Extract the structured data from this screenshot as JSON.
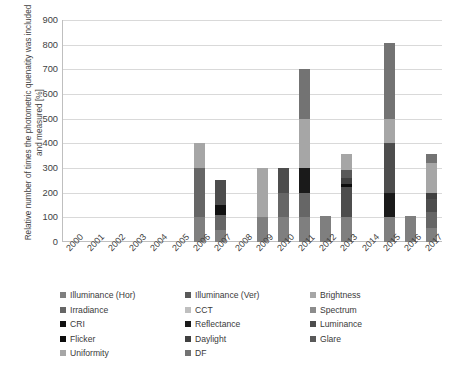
{
  "chart_data": {
    "type": "bar",
    "stacked": true,
    "title": "",
    "xlabel": "",
    "ylabel": "Relative number of times the photometric quenatity was included and measured [%]",
    "ylim": [
      0,
      900
    ],
    "ytick_step": 100,
    "yticks": [
      "0",
      "100",
      "200",
      "300",
      "400",
      "500",
      "600",
      "700",
      "800",
      "900"
    ],
    "grid": true,
    "legend_position": "bottom",
    "categories": [
      "2000",
      "2001",
      "2002",
      "2003",
      "2004",
      "2005",
      "2006",
      "2007",
      "2008",
      "2009",
      "2010",
      "2011",
      "2012",
      "2013",
      "2014",
      "2015",
      "2016",
      "2017"
    ],
    "series": [
      {
        "name": "Illuminance (Hor)",
        "color": "#7f7f7f",
        "values": [
          0,
          0,
          0,
          0,
          0,
          0,
          100,
          50,
          0,
          100,
          100,
          100,
          105,
          100,
          0,
          100,
          105,
          55
        ]
      },
      {
        "name": "Illuminance (Ver)",
        "color": "#595959",
        "values": [
          0,
          0,
          0,
          0,
          0,
          0,
          0,
          0,
          0,
          0,
          0,
          0,
          0,
          0,
          0,
          0,
          0,
          0
        ]
      },
      {
        "name": "Brightness",
        "color": "#a6a6a6",
        "values": [
          0,
          0,
          0,
          0,
          0,
          0,
          0,
          0,
          0,
          0,
          0,
          0,
          0,
          0,
          0,
          0,
          0,
          0
        ]
      },
      {
        "name": "Irradiance",
        "color": "#666666",
        "values": [
          0,
          0,
          0,
          0,
          0,
          0,
          200,
          60,
          0,
          0,
          100,
          100,
          0,
          0,
          0,
          0,
          0,
          65
        ]
      },
      {
        "name": "CCT",
        "color": "#bfbfbf",
        "values": [
          0,
          0,
          0,
          0,
          0,
          0,
          0,
          0,
          0,
          0,
          0,
          0,
          0,
          0,
          0,
          0,
          0,
          0
        ]
      },
      {
        "name": "Spectrum",
        "color": "#8c8c8c",
        "values": [
          0,
          0,
          0,
          0,
          0,
          0,
          0,
          0,
          0,
          0,
          0,
          0,
          0,
          0,
          0,
          0,
          0,
          0
        ]
      },
      {
        "name": "CRI",
        "color": "#111111",
        "values": [
          0,
          0,
          0,
          0,
          0,
          0,
          0,
          40,
          0,
          0,
          0,
          0,
          0,
          0,
          0,
          0,
          0,
          0
        ]
      },
      {
        "name": "Reflectance",
        "color": "#1a1a1a",
        "values": [
          0,
          0,
          0,
          0,
          0,
          0,
          0,
          0,
          0,
          0,
          0,
          100,
          0,
          0,
          0,
          100,
          0,
          0
        ]
      },
      {
        "name": "Luminance",
        "color": "#4d4d4d",
        "values": [
          0,
          0,
          0,
          0,
          0,
          0,
          0,
          100,
          0,
          0,
          100,
          0,
          0,
          125,
          0,
          200,
          0,
          55
        ]
      },
      {
        "name": "Flicker",
        "color": "#0d0d0d",
        "values": [
          0,
          0,
          0,
          0,
          0,
          0,
          0,
          0,
          0,
          0,
          0,
          0,
          0,
          10,
          0,
          0,
          0,
          0
        ]
      },
      {
        "name": "Daylight",
        "color": "#404040",
        "values": [
          0,
          0,
          0,
          0,
          0,
          0,
          0,
          0,
          0,
          0,
          0,
          0,
          0,
          25,
          0,
          0,
          0,
          25
        ]
      },
      {
        "name": "Glare",
        "color": "#595959",
        "values": [
          0,
          0,
          0,
          0,
          0,
          0,
          0,
          0,
          0,
          0,
          0,
          0,
          0,
          30,
          0,
          0,
          0,
          0
        ]
      },
      {
        "name": "Uniformity",
        "color": "#a6a6a6",
        "values": [
          0,
          0,
          0,
          0,
          0,
          0,
          100,
          0,
          0,
          200,
          0,
          200,
          0,
          65,
          0,
          100,
          0,
          120
        ]
      },
      {
        "name": "DF",
        "color": "#737373",
        "values": [
          0,
          0,
          0,
          0,
          0,
          0,
          0,
          0,
          0,
          0,
          0,
          200,
          0,
          0,
          0,
          305,
          0,
          35
        ]
      }
    ],
    "totals": [
      0,
      0,
      0,
      0,
      0,
      0,
      400,
      250,
      0,
      400,
      300,
      700,
      105,
      355,
      0,
      805,
      105,
      355
    ]
  },
  "legend": {
    "items": [
      {
        "label": "Illuminance (Hor)",
        "swatch": "#7f7f7f"
      },
      {
        "label": "Illuminance (Ver)",
        "swatch": "#595959"
      },
      {
        "label": "Brightness",
        "swatch": "#a6a6a6"
      },
      {
        "label": "Irradiance",
        "swatch": "#666666"
      },
      {
        "label": "CCT",
        "swatch": "#bfbfbf"
      },
      {
        "label": "Spectrum",
        "swatch": "#8c8c8c"
      },
      {
        "label": "CRI",
        "swatch": "#111111"
      },
      {
        "label": "Reflectance",
        "swatch": "#1a1a1a"
      },
      {
        "label": "Luminance",
        "swatch": "#4d4d4d"
      },
      {
        "label": "Flicker",
        "swatch": "#0d0d0d"
      },
      {
        "label": "Daylight",
        "swatch": "#404040"
      },
      {
        "label": "Glare",
        "swatch": "#595959"
      },
      {
        "label": "Uniformity",
        "swatch": "#a6a6a6"
      },
      {
        "label": "DF",
        "swatch": "#737373"
      }
    ]
  }
}
